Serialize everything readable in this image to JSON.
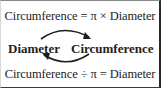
{
  "diagram": {
    "formula_top": "Circumference = π × Diameter",
    "left_term": "Diameter",
    "right_term": "Circumference",
    "formula_bottom": "Circumference ÷ π = Diameter",
    "arrows": [
      {
        "from": "Diameter",
        "to": "Circumference",
        "position": "top",
        "operation": "× π"
      },
      {
        "from": "Circumference",
        "to": "Diameter",
        "position": "bottom",
        "operation": "÷ π"
      }
    ],
    "colors": {
      "text": "#1e1e1e",
      "arrow": "#1e1e1e",
      "background": "#ffffff"
    }
  }
}
